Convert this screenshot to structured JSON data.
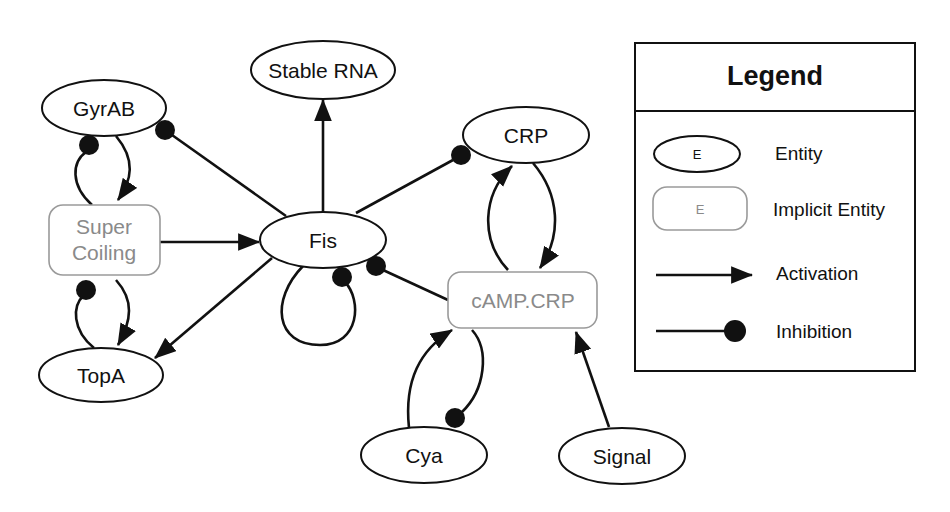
{
  "diagram": {
    "type": "regulatory-network",
    "nodes": [
      {
        "id": "gyrab",
        "label": "GyrAB",
        "kind": "entity"
      },
      {
        "id": "stable_rna",
        "label": "Stable RNA",
        "kind": "entity"
      },
      {
        "id": "crp",
        "label": "CRP",
        "kind": "entity"
      },
      {
        "id": "fis",
        "label": "Fis",
        "kind": "entity"
      },
      {
        "id": "supercoiling",
        "label_line1": "Super",
        "label_line2": "Coiling",
        "kind": "implicit"
      },
      {
        "id": "topa",
        "label": "TopA",
        "kind": "entity"
      },
      {
        "id": "camp_crp",
        "label": "cAMP.CRP",
        "kind": "implicit"
      },
      {
        "id": "cya",
        "label": "Cya",
        "kind": "entity"
      },
      {
        "id": "signal",
        "label": "Signal",
        "kind": "entity"
      }
    ],
    "edges": [
      {
        "from": "Fis",
        "to": "GyrAB",
        "type": "inhibition"
      },
      {
        "from": "Fis",
        "to": "Stable RNA",
        "type": "activation"
      },
      {
        "from": "Fis",
        "to": "CRP",
        "type": "inhibition"
      },
      {
        "from": "Fis",
        "to": "TopA",
        "type": "activation"
      },
      {
        "from": "Fis",
        "to": "Fis",
        "type": "inhibition"
      },
      {
        "from": "cAMP.CRP",
        "to": "Fis",
        "type": "inhibition"
      },
      {
        "from": "Super Coiling",
        "to": "Fis",
        "type": "activation"
      },
      {
        "from": "GyrAB",
        "to": "Super Coiling",
        "type": "activation"
      },
      {
        "from": "Super Coiling",
        "to": "GyrAB",
        "type": "inhibition"
      },
      {
        "from": "TopA",
        "to": "Super Coiling",
        "type": "inhibition"
      },
      {
        "from": "Super Coiling",
        "to": "TopA",
        "type": "activation"
      },
      {
        "from": "CRP",
        "to": "cAMP.CRP",
        "type": "activation"
      },
      {
        "from": "cAMP.CRP",
        "to": "CRP",
        "type": "activation"
      },
      {
        "from": "Cya",
        "to": "cAMP.CRP",
        "type": "activation"
      },
      {
        "from": "cAMP.CRP",
        "to": "Cya",
        "type": "inhibition"
      },
      {
        "from": "Signal",
        "to": "cAMP.CRP",
        "type": "activation"
      }
    ]
  },
  "legend": {
    "title": "Legend",
    "items": [
      {
        "symbol": "E",
        "label": "Entity"
      },
      {
        "symbol": "E",
        "label": "Implicit Entity"
      },
      {
        "label": "Activation"
      },
      {
        "label": "Inhibition"
      }
    ]
  },
  "colors": {
    "line": "#111111",
    "implicit_border": "#9a9a9a",
    "implicit_text": "#8a8a8a",
    "background": "#ffffff"
  }
}
